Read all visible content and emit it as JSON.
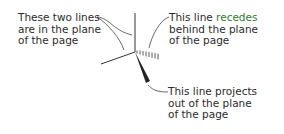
{
  "diagram": {
    "labels": {
      "in_plane": "These two lines\nare in the plane\nof the page",
      "recedes_prefix": "This line ",
      "recedes_highlight": "recedes",
      "recedes_rest": "\nbehind the plane\nof the page",
      "projects": "This line projects\nout of the plane\nof the page"
    },
    "colors": {
      "text": "#2b2b2b",
      "highlight": "#2e7d32",
      "lines": "#333333"
    },
    "icons": {
      "bond_in_plane": "plain-line",
      "bond_recede": "hashed-wedge",
      "bond_project": "solid-wedge"
    }
  }
}
